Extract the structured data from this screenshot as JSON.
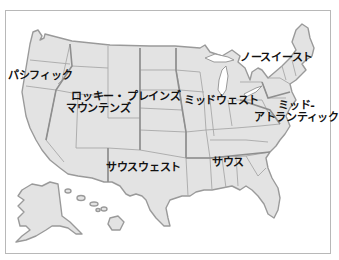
{
  "map": {
    "title": "US regions map",
    "colors": {
      "land": "#e3e3e3",
      "border": "#9a9a9a",
      "frame": "#b8b8b8",
      "label": "#111111"
    },
    "regions": [
      {
        "id": "pacific",
        "label": "パシフィック"
      },
      {
        "id": "rocky-mountains",
        "label_line1": "ロッキー・",
        "label_line2": "マウンテンズ"
      },
      {
        "id": "plains",
        "label": "プレインズ"
      },
      {
        "id": "midwest",
        "label": "ミッドウェスト"
      },
      {
        "id": "northeast",
        "label": "ノースイースト"
      },
      {
        "id": "mid-atlantic",
        "label_line1": "ミッド-",
        "label_line2": "アトランティック"
      },
      {
        "id": "southwest",
        "label": "サウスウェスト"
      },
      {
        "id": "south",
        "label": "サウス"
      }
    ]
  }
}
